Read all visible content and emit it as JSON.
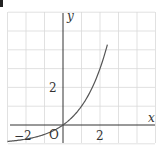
{
  "chart_data": {
    "type": "line",
    "title": "",
    "xlabel": "x",
    "ylabel": "y",
    "origin_label": "O",
    "x_tick_labels": [
      {
        "value": -2,
        "label": "−2"
      },
      {
        "value": 2,
        "label": "2"
      }
    ],
    "y_tick_labels": [
      {
        "value": 2,
        "label": "2"
      }
    ],
    "xlim": [
      -3,
      5
    ],
    "ylim": [
      -1,
      6
    ],
    "grid": true,
    "grid_step": 1,
    "series": [
      {
        "name": "y = 2^x − 1",
        "x": [
          -3.0,
          -2.5,
          -2.0,
          -1.5,
          -1.0,
          -0.5,
          0.0,
          0.5,
          1.0,
          1.5,
          2.0,
          2.4
        ],
        "values": [
          -0.88,
          -0.82,
          -0.75,
          -0.65,
          -0.5,
          -0.29,
          0.0,
          0.41,
          1.0,
          1.83,
          3.0,
          4.28
        ],
        "color": "#555555"
      }
    ],
    "legend": null
  },
  "colors": {
    "axis": "#333333",
    "grid": "#d9d9d9",
    "curve": "#555555"
  }
}
